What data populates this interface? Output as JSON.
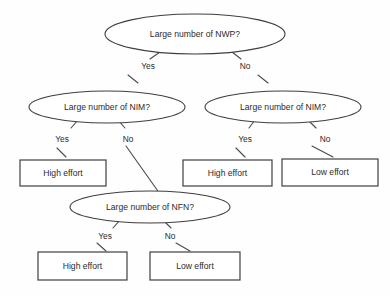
{
  "diagram": {
    "type": "decision-tree",
    "title": "",
    "background_color": "#fefefe",
    "stroke_color": "#3f3f3f",
    "text_color": "#2b2b2b",
    "decision_nodes": [
      {
        "id": "root-nwp",
        "label": "Large number of NWP?",
        "cx": 195,
        "cy": 34,
        "rx": 90,
        "ry": 20
      },
      {
        "id": "left-nim",
        "label": "Large number of NIM?",
        "cx": 107,
        "cy": 107,
        "rx": 78,
        "ry": 16
      },
      {
        "id": "right-nim",
        "label": "Large number of NIM?",
        "cx": 283,
        "cy": 107,
        "rx": 78,
        "ry": 16
      },
      {
        "id": "nfn",
        "label": "Large number of NFN?",
        "cx": 150,
        "cy": 207,
        "rx": 80,
        "ry": 16
      }
    ],
    "outcome_nodes": [
      {
        "id": "outcome-1",
        "label": "High effort",
        "x": 20,
        "y": 160,
        "w": 86,
        "h": 26
      },
      {
        "id": "outcome-2",
        "label": "High effort",
        "x": 183,
        "y": 160,
        "w": 89,
        "h": 26
      },
      {
        "id": "outcome-3",
        "label": "Low effort",
        "x": 282,
        "y": 159,
        "w": 96,
        "h": 27
      },
      {
        "id": "outcome-4",
        "label": "High effort",
        "x": 38,
        "y": 252,
        "w": 89,
        "h": 28
      },
      {
        "id": "outcome-5",
        "label": "Low effort",
        "x": 150,
        "y": 252,
        "w": 90,
        "h": 28
      }
    ],
    "edges": [
      {
        "id": "edge-root-yes",
        "from": "root-nwp",
        "to": "left-nim",
        "x1": 160,
        "y1": 52,
        "x2": 150,
        "y2": 59
      },
      {
        "id": "edge-root-no",
        "from": "root-nwp",
        "to": "right-nim",
        "x1": 232,
        "y1": 52,
        "x2": 241,
        "y2": 59
      },
      {
        "id": "edge-yes-tail-left",
        "from": "root-nwp",
        "to": "left-nim",
        "x1": 128,
        "y1": 75,
        "x2": 138,
        "y2": 83
      },
      {
        "id": "edge-no-tail-right",
        "from": "root-nwp",
        "to": "right-nim",
        "x1": 258,
        "y1": 75,
        "x2": 268,
        "y2": 83
      },
      {
        "id": "edge-lnim-yes",
        "from": "left-nim",
        "to": "outcome-1",
        "x1": 78,
        "y1": 120,
        "x2": 71,
        "y2": 128
      },
      {
        "id": "edge-lnim-yes-tail",
        "from": "left-nim",
        "to": "outcome-1",
        "x1": 57,
        "y1": 148,
        "x2": 66,
        "y2": 157
      },
      {
        "id": "edge-lnim-no",
        "from": "left-nim",
        "to": "nfn",
        "x1": 118,
        "y1": 120,
        "x2": 125,
        "y2": 128
      },
      {
        "id": "edge-lnim-no-long",
        "from": "left-nim",
        "to": "nfn",
        "x1": 126,
        "y1": 146,
        "x2": 160,
        "y2": 194
      },
      {
        "id": "edge-rnim-yes",
        "from": "right-nim",
        "to": "outcome-2",
        "x1": 255,
        "y1": 120,
        "x2": 249,
        "y2": 128
      },
      {
        "id": "edge-rnim-yes-tail",
        "from": "right-nim",
        "to": "outcome-2",
        "x1": 236,
        "y1": 148,
        "x2": 245,
        "y2": 157
      },
      {
        "id": "edge-rnim-no",
        "from": "right-nim",
        "to": "outcome-3",
        "x1": 308,
        "y1": 120,
        "x2": 316,
        "y2": 128
      },
      {
        "id": "edge-rnim-no-tail",
        "from": "right-nim",
        "to": "outcome-3",
        "x1": 312,
        "y1": 146,
        "x2": 333,
        "y2": 157
      },
      {
        "id": "edge-nfn-yes",
        "from": "nfn",
        "to": "outcome-4",
        "x1": 120,
        "y1": 220,
        "x2": 113,
        "y2": 228
      },
      {
        "id": "edge-nfn-yes-tail",
        "from": "nfn",
        "to": "outcome-4",
        "x1": 97,
        "y1": 243,
        "x2": 106,
        "y2": 251
      },
      {
        "id": "edge-nfn-no",
        "from": "nfn",
        "to": "outcome-5",
        "x1": 163,
        "y1": 220,
        "x2": 171,
        "y2": 228
      },
      {
        "id": "edge-nfn-no-tail",
        "from": "nfn",
        "to": "outcome-5",
        "x1": 176,
        "y1": 243,
        "x2": 190,
        "y2": 251
      }
    ],
    "edge_labels": [
      {
        "id": "label-root-yes",
        "text": "Yes",
        "x": 148,
        "y": 67
      },
      {
        "id": "label-root-no",
        "text": "No",
        "x": 245,
        "y": 67
      },
      {
        "id": "label-lnim-yes",
        "text": "Yes",
        "x": 62,
        "y": 140
      },
      {
        "id": "label-lnim-no",
        "text": "No",
        "x": 128,
        "y": 140
      },
      {
        "id": "label-rnim-yes",
        "text": "Yes",
        "x": 245,
        "y": 140
      },
      {
        "id": "label-rnim-no",
        "text": "No",
        "x": 325,
        "y": 140
      },
      {
        "id": "label-nfn-yes",
        "text": "Yes",
        "x": 105,
        "y": 237
      },
      {
        "id": "label-nfn-no",
        "text": "No",
        "x": 170,
        "y": 237
      }
    ]
  }
}
